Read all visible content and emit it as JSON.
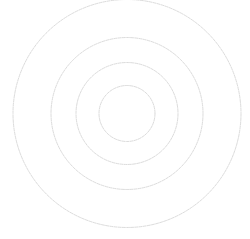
{
  "figure": {
    "type": "concentric-circles",
    "background": "#ffffff",
    "stroke_color": "#dcdcdc",
    "stroke_dash": "3 1.2",
    "center": {
      "x": 127,
      "y": 113.5
    },
    "rings": [
      {
        "name": "ring-outer",
        "radius": 114
      },
      {
        "name": "ring-third",
        "radius": 76
      },
      {
        "name": "ring-second",
        "radius": 51
      },
      {
        "name": "ring-inner",
        "radius": 28
      }
    ]
  }
}
